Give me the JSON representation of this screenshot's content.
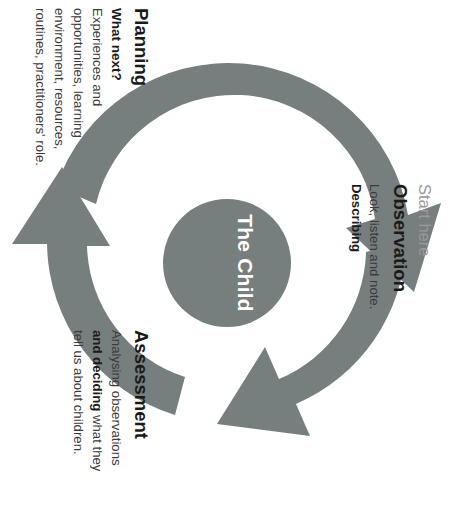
{
  "diagram": {
    "centre": {
      "label": "The Child"
    },
    "colors": {
      "arrow_gray": "#777e7e",
      "circle_gray": "#777e7e",
      "centre_text": "#ffffff",
      "muted_text": "#9a9a9a",
      "body_text": "#3b3b3b",
      "heading_text": "#1a1a1a"
    },
    "stages": [
      {
        "id": "observation",
        "pre_label": "Start here",
        "title": "Observation",
        "body_plain": "Look, listen and note. Describing",
        "body_line_1": "Look, listen and note.",
        "body_bold_1": "Describing"
      },
      {
        "id": "assessment",
        "title": "Assessment",
        "body_plain": "Analysing observations and deciding what they tell us about children.",
        "body_part_1": "Analysing observations",
        "body_bold_1": "and deciding",
        "body_part_2": " what they",
        "body_part_3": "tell us about children."
      },
      {
        "id": "planning",
        "title": "Planning",
        "sub_label": "What next?",
        "body_plain": "Experiences and opportunities, learning environment, resources, routines, practitioners' role.",
        "body_line_1": "Experiences and",
        "body_line_2": "opportunities, learning",
        "body_line_3": "environment, resources,",
        "body_line_4": "routines, practitioners' role."
      }
    ],
    "arrows": [
      {
        "id": "arrow-observation-to-assessment",
        "from": "observation",
        "to": "assessment"
      },
      {
        "id": "arrow-assessment-to-planning",
        "from": "assessment",
        "to": "planning"
      },
      {
        "id": "arrow-planning-to-observation",
        "from": "planning",
        "to": "observation"
      }
    ]
  }
}
